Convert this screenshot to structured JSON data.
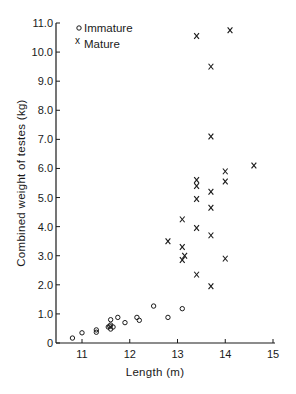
{
  "chart_data": {
    "type": "scatter",
    "title": "",
    "xlabel": "Length (m)",
    "ylabel": "Combined weight of testes (kg)",
    "xlim": [
      10.5,
      15
    ],
    "ylim": [
      0,
      11
    ],
    "xticks": [
      "11",
      "12",
      "13",
      "14",
      "15"
    ],
    "yticks": [
      "0",
      "1.0",
      "2.0",
      "3.0",
      "4.0",
      "5.0",
      "6.0",
      "7.0",
      "8.0",
      "9.0",
      "10.0",
      "11.0"
    ],
    "grid": false,
    "legend_position": "top-left",
    "series": [
      {
        "name": "Immature",
        "marker": "circle",
        "points": [
          {
            "x": 10.8,
            "y": 0.17
          },
          {
            "x": 11.0,
            "y": 0.35
          },
          {
            "x": 11.3,
            "y": 0.45
          },
          {
            "x": 11.3,
            "y": 0.37
          },
          {
            "x": 11.55,
            "y": 0.55
          },
          {
            "x": 11.6,
            "y": 0.62
          },
          {
            "x": 11.65,
            "y": 0.55
          },
          {
            "x": 11.6,
            "y": 0.48
          },
          {
            "x": 11.58,
            "y": 0.58
          },
          {
            "x": 11.6,
            "y": 0.8
          },
          {
            "x": 11.75,
            "y": 0.88
          },
          {
            "x": 11.9,
            "y": 0.7
          },
          {
            "x": 12.15,
            "y": 0.88
          },
          {
            "x": 12.2,
            "y": 0.78
          },
          {
            "x": 12.5,
            "y": 1.27
          },
          {
            "x": 12.8,
            "y": 0.88
          },
          {
            "x": 13.1,
            "y": 1.18
          }
        ]
      },
      {
        "name": "Mature",
        "marker": "x",
        "points": [
          {
            "x": 12.8,
            "y": 3.5
          },
          {
            "x": 13.1,
            "y": 4.25
          },
          {
            "x": 13.1,
            "y": 3.3
          },
          {
            "x": 13.15,
            "y": 3.0
          },
          {
            "x": 13.1,
            "y": 2.85
          },
          {
            "x": 13.4,
            "y": 10.55
          },
          {
            "x": 13.4,
            "y": 5.6
          },
          {
            "x": 13.4,
            "y": 5.4
          },
          {
            "x": 13.4,
            "y": 4.95
          },
          {
            "x": 13.4,
            "y": 3.95
          },
          {
            "x": 13.4,
            "y": 2.35
          },
          {
            "x": 13.7,
            "y": 9.5
          },
          {
            "x": 13.7,
            "y": 7.1
          },
          {
            "x": 13.7,
            "y": 5.2
          },
          {
            "x": 13.7,
            "y": 4.65
          },
          {
            "x": 13.7,
            "y": 3.7
          },
          {
            "x": 13.7,
            "y": 1.95
          },
          {
            "x": 14.0,
            "y": 5.9
          },
          {
            "x": 14.0,
            "y": 5.55
          },
          {
            "x": 14.0,
            "y": 2.9
          },
          {
            "x": 14.1,
            "y": 10.75
          },
          {
            "x": 14.6,
            "y": 6.1
          }
        ]
      }
    ]
  },
  "legend": {
    "immature_label": "Immature",
    "mature_label": "Mature",
    "mature_glyph": "x"
  },
  "axes": {
    "x_label": "Length (m)",
    "y_label": "Combined weight of testes (kg)"
  },
  "style": {
    "ink": "#1a1a1a",
    "background": "#ffffff"
  }
}
